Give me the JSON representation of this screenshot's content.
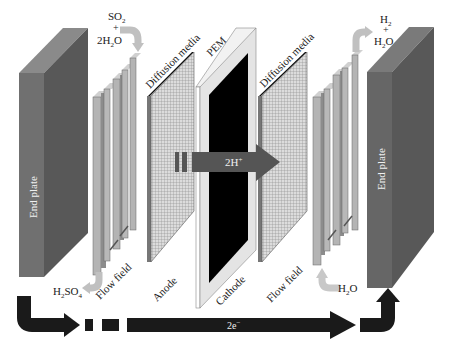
{
  "diagram": {
    "type": "PEM electrolyzer cell (exploded view)",
    "components": {
      "left_end_plate": "End plate",
      "left_flow_field": "Flow field",
      "left_diffusion_media": "Diffusion media",
      "anode": "Anode",
      "pem": "PEM",
      "cathode": "Cathode",
      "right_diffusion_media": "Diffusion media",
      "right_flow_field": "Flow field",
      "right_end_plate": "End plate"
    },
    "flows": {
      "anode_inlet": {
        "line1": "SO",
        "sub1": "2",
        "line2": "+",
        "line3": "2H",
        "sub3": "2",
        "line3b": "O"
      },
      "anode_outlet": {
        "text": "H",
        "sub": "2",
        "text2": "SO",
        "sub2": "4"
      },
      "cathode_inlet": {
        "text": "H",
        "sub": "2",
        "text2": "O"
      },
      "cathode_outlet": {
        "line1": "H",
        "sub1": "2",
        "line2": "+",
        "line3": "H",
        "sub3": "2",
        "line3b": "O"
      },
      "proton_flow": {
        "text": "2H",
        "sup": "+"
      },
      "electron_flow": {
        "text": "2e",
        "sup": "−"
      }
    },
    "colors": {
      "end_plate_front": "#6b6b6b",
      "end_plate_side": "#575757",
      "end_plate_top": "#8a8a8a",
      "flow_field": "#b8b8b8",
      "diffusion_grid": "#d8d8d8",
      "pem_frame": "#ececec",
      "catalyst": "#000000",
      "proton_arrow": "#555555",
      "electron_arrow": "#1a1a1a",
      "flow_arrow": "#c8c8c8"
    }
  }
}
